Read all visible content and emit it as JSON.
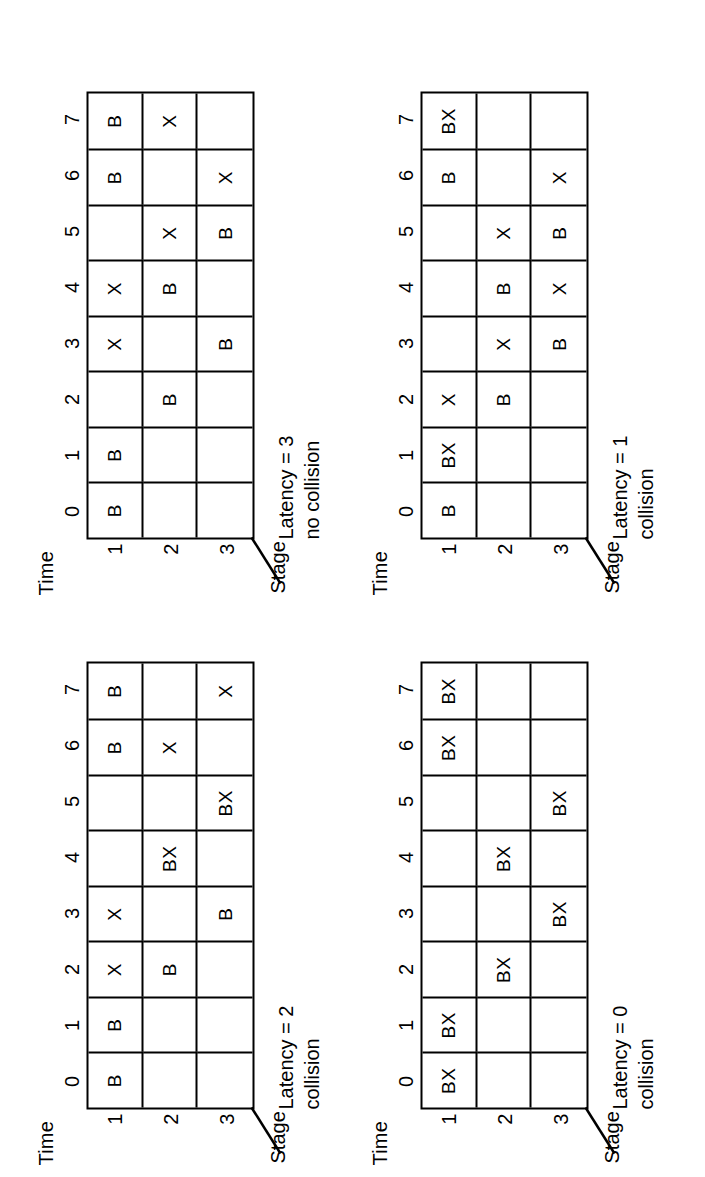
{
  "figure": {
    "axis": {
      "time_label": "Time",
      "stage_label": "Stage",
      "time_ticks": [
        "0",
        "1",
        "2",
        "3",
        "4",
        "5",
        "6",
        "7"
      ],
      "stage_ticks": [
        "1",
        "2",
        "3"
      ]
    },
    "ink_color": "#000000",
    "background_color": "#ffffff"
  },
  "panels": [
    {
      "id": "latency-0",
      "caption_line1": "Latency = 0",
      "caption_line2": "collision",
      "rows": [
        [
          "BX",
          "BX",
          "",
          "",
          "",
          "",
          "BX",
          "BX"
        ],
        [
          "",
          "",
          "BX",
          "",
          "BX",
          "",
          "",
          ""
        ],
        [
          "",
          "",
          "",
          "BX",
          "",
          "BX",
          "",
          ""
        ]
      ]
    },
    {
      "id": "latency-1",
      "caption_line1": "Latency = 1",
      "caption_line2": "collision",
      "rows": [
        [
          "B",
          "BX",
          "X",
          "",
          "",
          "",
          "B",
          "BX"
        ],
        [
          "",
          "",
          "B",
          "X",
          "B",
          "X",
          "",
          ""
        ],
        [
          "",
          "",
          "",
          "B",
          "X",
          "B",
          "X",
          ""
        ]
      ]
    },
    {
      "id": "latency-2",
      "caption_line1": "Latency = 2",
      "caption_line2": "collision",
      "rows": [
        [
          "B",
          "B",
          "X",
          "X",
          "",
          "",
          "B",
          "B"
        ],
        [
          "",
          "",
          "B",
          "",
          "BX",
          "",
          "X",
          ""
        ],
        [
          "",
          "",
          "",
          "B",
          "",
          "BX",
          "",
          "X"
        ]
      ]
    },
    {
      "id": "latency-3",
      "caption_line1": "Latency = 3",
      "caption_line2": "no collision",
      "rows": [
        [
          "B",
          "B",
          "",
          "X",
          "X",
          "",
          "B",
          "B"
        ],
        [
          "",
          "",
          "B",
          "",
          "B",
          "X",
          "",
          "X"
        ],
        [
          "",
          "",
          "",
          "B",
          "",
          "B",
          "X",
          ""
        ]
      ]
    }
  ]
}
